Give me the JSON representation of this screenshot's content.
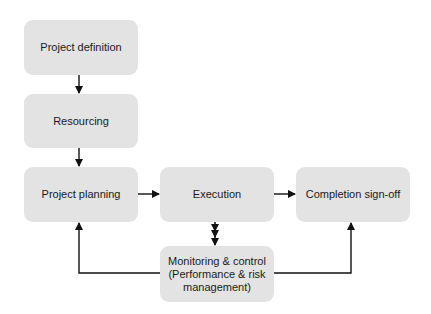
{
  "diagram": {
    "type": "flowchart",
    "colors": {
      "box_fill": "#e3e3e3",
      "arrow": "#111111",
      "text": "#1a1a1a"
    },
    "nodes": [
      {
        "id": "definition",
        "label": "Project definition"
      },
      {
        "id": "resourcing",
        "label": "Resourcing"
      },
      {
        "id": "planning",
        "label": "Project planning"
      },
      {
        "id": "execution",
        "label": "Execution"
      },
      {
        "id": "completion",
        "label": "Completion sign-off"
      },
      {
        "id": "monitoring",
        "label_lines": [
          "Monitoring & control",
          "(Performance & risk",
          "management)"
        ]
      }
    ],
    "edges": [
      {
        "from": "definition",
        "to": "resourcing"
      },
      {
        "from": "resourcing",
        "to": "planning"
      },
      {
        "from": "planning",
        "to": "execution"
      },
      {
        "from": "execution",
        "to": "completion"
      },
      {
        "from": "execution",
        "to": "monitoring",
        "bidirectional": true
      },
      {
        "from": "monitoring",
        "to": "planning"
      },
      {
        "from": "monitoring",
        "to": "completion"
      }
    ]
  }
}
